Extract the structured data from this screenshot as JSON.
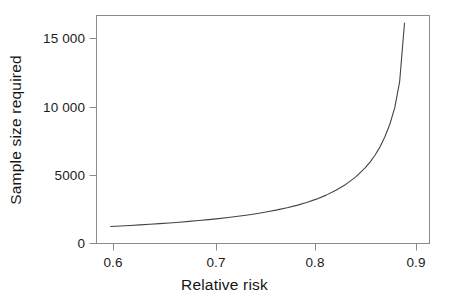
{
  "chart_data": {
    "type": "line",
    "title": "",
    "xlabel": "Relative risk",
    "ylabel": "Sample size required",
    "xlim": [
      0.585,
      0.925
    ],
    "ylim": [
      -350,
      16700
    ],
    "grid": false,
    "legend": null,
    "xticks": [
      0.6,
      0.7,
      0.8,
      0.9
    ],
    "xtick_labels": [
      "0.6",
      "0.7",
      "0.8",
      "0.9"
    ],
    "yticks": [
      0,
      5000,
      10000,
      15000
    ],
    "ytick_labels": [
      "0",
      "5000",
      "10 000",
      "15 000"
    ],
    "line_color": "#444444",
    "frame_color": "#8a8a8a",
    "series": [
      {
        "name": "Sample size required",
        "x": [
          0.6,
          0.61,
          0.62,
          0.63,
          0.64,
          0.65,
          0.66,
          0.67,
          0.68,
          0.69,
          0.7,
          0.71,
          0.72,
          0.73,
          0.74,
          0.75,
          0.76,
          0.77,
          0.78,
          0.79,
          0.8,
          0.81,
          0.82,
          0.83,
          0.84,
          0.85,
          0.86,
          0.865,
          0.87,
          0.875,
          0.88,
          0.885,
          0.89,
          0.895,
          0.9
        ],
        "values": [
          880,
          920,
          960,
          1005,
          1050,
          1100,
          1150,
          1205,
          1265,
          1330,
          1400,
          1475,
          1560,
          1650,
          1750,
          1860,
          1985,
          2125,
          2285,
          2465,
          2680,
          2930,
          3230,
          3590,
          4030,
          4580,
          5290,
          5720,
          6230,
          6840,
          7590,
          8530,
          9750,
          11700,
          16100
        ]
      }
    ]
  },
  "axis_geometry": {
    "plot_left": 96,
    "plot_right": 429,
    "plot_top": 15,
    "plot_bottom": 243,
    "xtick_px": [
      113,
      216,
      315,
      416
    ],
    "ytick_px": [
      243,
      175,
      107,
      38
    ]
  }
}
